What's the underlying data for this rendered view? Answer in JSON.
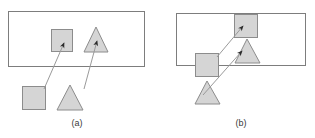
{
  "figure": {
    "width": 315,
    "height": 138,
    "background": "#ffffff",
    "colors": {
      "shape_fill": "#d5d5d5",
      "shape_stroke": "#8c8c8c",
      "rect_stroke": "#7d7d7d",
      "arrow_line": "#9a9a9a",
      "arrow_head": "#2b2b2b",
      "caption_text": "#3a3a3a"
    }
  },
  "panels": [
    {
      "id": "a",
      "caption": "(a)",
      "caption_position": {
        "x": 77,
        "y": 123
      },
      "container": {
        "name": "region-rectangle",
        "x": 8,
        "y": 11,
        "width": 137,
        "height": 56
      },
      "shapes_inside": [
        {
          "name": "square-inside",
          "type": "square",
          "x": 51,
          "y": 29,
          "width": 22,
          "height": 23,
          "filled": true
        },
        {
          "name": "triangle-inside",
          "type": "triangle",
          "apex": {
            "x": 96,
            "y": 27
          },
          "base_left": {
            "x": 84,
            "y": 52
          },
          "base_right": {
            "x": 108,
            "y": 52
          },
          "filled": true
        }
      ],
      "shapes_outside": [
        {
          "name": "square-outside",
          "type": "square",
          "x": 22,
          "y": 86,
          "width": 24,
          "height": 24,
          "filled": true
        },
        {
          "name": "triangle-outside",
          "type": "triangle",
          "apex": {
            "x": 70,
            "y": 85
          },
          "base_left": {
            "x": 57,
            "y": 110
          },
          "base_right": {
            "x": 83,
            "y": 110
          },
          "filled": true
        }
      ],
      "arrows": [
        {
          "name": "arrow-square-a",
          "from": {
            "x": 44,
            "y": 89
          },
          "to": {
            "x": 64,
            "y": 43
          }
        },
        {
          "name": "arrow-triangle-a",
          "from": {
            "x": 84,
            "y": 89
          },
          "to": {
            "x": 97,
            "y": 41
          }
        }
      ]
    },
    {
      "id": "b",
      "caption": "(b)",
      "caption_position": {
        "x": 241,
        "y": 123
      },
      "container": {
        "name": "region-rectangle",
        "x": 176,
        "y": 13,
        "width": 130,
        "height": 53
      },
      "shapes_inside": [
        {
          "name": "square-inside",
          "type": "square",
          "x": 234,
          "y": 14,
          "width": 24,
          "height": 24,
          "filled": true
        },
        {
          "name": "triangle-inside",
          "type": "triangle",
          "apex": {
            "x": 247,
            "y": 39
          },
          "base_left": {
            "x": 235,
            "y": 63
          },
          "base_right": {
            "x": 260,
            "y": 63
          },
          "filled": true
        }
      ],
      "shapes_outside": [
        {
          "name": "square-straddling",
          "type": "square",
          "x": 195,
          "y": 53,
          "width": 24,
          "height": 24,
          "filled": true
        },
        {
          "name": "triangle-outside",
          "type": "triangle",
          "apex": {
            "x": 207,
            "y": 81
          },
          "base_left": {
            "x": 195,
            "y": 104
          },
          "base_right": {
            "x": 220,
            "y": 104
          },
          "filled": true
        }
      ],
      "arrows": [
        {
          "name": "arrow-square-b",
          "from": {
            "x": 217,
            "y": 57
          },
          "to": {
            "x": 243,
            "y": 26
          }
        },
        {
          "name": "arrow-triangle-b",
          "from": {
            "x": 203,
            "y": 95
          },
          "to": {
            "x": 242,
            "y": 51
          }
        }
      ]
    }
  ]
}
